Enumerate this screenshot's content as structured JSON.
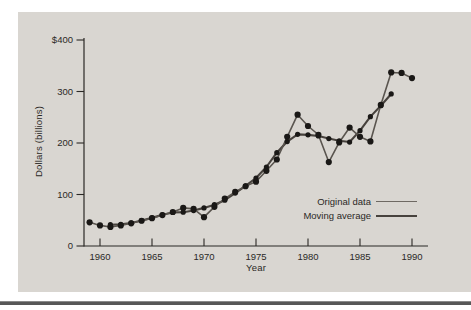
{
  "chart_data": {
    "type": "line",
    "title": "",
    "xlabel": "Year",
    "ylabel": "Dollars (billions)",
    "x_tick_years": [
      1960,
      1965,
      1970,
      1975,
      1980,
      1985,
      1990
    ],
    "y_tick_values": [
      0,
      100,
      200,
      300,
      400
    ],
    "y_tick_labels": [
      "0",
      "100",
      "200",
      "300",
      "$400"
    ],
    "xlim": [
      1958.5,
      1991.5
    ],
    "ylim": [
      0,
      400
    ],
    "grid": false,
    "legend_position": "inside-right",
    "series": [
      {
        "name": "Original data",
        "start_year": 1959,
        "values": [
          46,
          40,
          37,
          40,
          44,
          49,
          54,
          60,
          66,
          74,
          72,
          56,
          76,
          92,
          105,
          116,
          125,
          146,
          168,
          212,
          255,
          233,
          216,
          163,
          201,
          230,
          212,
          203,
          274,
          337,
          336,
          326
        ]
      },
      {
        "name": "Moving average",
        "start_year": 1961,
        "values": [
          41.4,
          42,
          44.8,
          49.4,
          54.6,
          60.6,
          65.2,
          65.6,
          68.8,
          74,
          80.2,
          89,
          102.8,
          116.8,
          132,
          153.4,
          181.2,
          202.8,
          216.8,
          215.8,
          213.6,
          208.6,
          204.4,
          201.8,
          224,
          251.2,
          272.4,
          295.2
        ]
      }
    ]
  },
  "legend": {
    "items": [
      {
        "label": "Original data"
      },
      {
        "label": "Moving average"
      }
    ]
  },
  "colors": {
    "panel_bg": "#d9d6d1",
    "ink": "#2b2926",
    "original_line": "#5a554f",
    "moving_average_line": "#47423d",
    "dot": "#1a1816",
    "bottom_rule": "#575757"
  }
}
